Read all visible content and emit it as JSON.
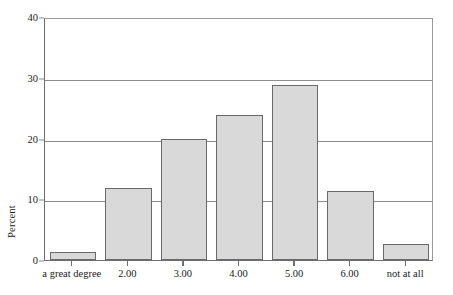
{
  "chart_data": {
    "type": "bar",
    "title": "",
    "xlabel": "",
    "ylabel": "Percent",
    "categories": [
      "a great degree",
      "2.00",
      "3.00",
      "4.00",
      "5.00",
      "6.00",
      "not at all"
    ],
    "values": [
      1.3,
      11.8,
      20.0,
      23.9,
      28.8,
      11.4,
      2.7
    ],
    "ylim": [
      0,
      40
    ],
    "yticks": [
      0,
      10,
      20,
      30,
      40
    ],
    "ytick_labels": [
      "0",
      "10",
      "20",
      "30",
      "40"
    ],
    "grid": true,
    "grid_axis": "y",
    "legend": false,
    "legend_position": "none",
    "bar_fill_color": "#d9d9d9",
    "bar_edge_color": "#6a6a6a",
    "gridline_color": "#8d8d8d",
    "axis_color": "#6e6e6e"
  },
  "axis": {
    "y_title": "Percent",
    "y_tick_labels": [
      "40",
      "30",
      "20",
      "10",
      "0"
    ],
    "x_tick_labels": [
      "a great degree",
      "2.00",
      "3.00",
      "4.00",
      "5.00",
      "6.00",
      "not at all"
    ]
  }
}
